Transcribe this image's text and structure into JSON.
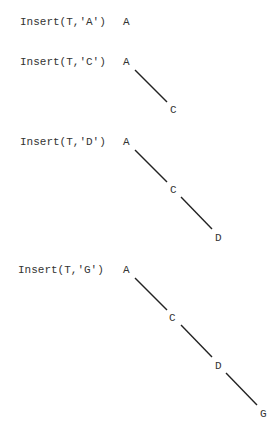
{
  "steps": [
    {
      "label": "Insert(T,'A')",
      "nodes": [
        "A"
      ]
    },
    {
      "label": "Insert(T,'C')",
      "nodes": [
        "A",
        "C"
      ]
    },
    {
      "label": "Insert(T,'D')",
      "nodes": [
        "A",
        "C",
        "D"
      ]
    },
    {
      "label": "Insert(T,'G')",
      "nodes": [
        "A",
        "C",
        "D",
        "G"
      ]
    }
  ],
  "colors": {
    "text": "#333333",
    "edge": "#222222",
    "background": "#ffffff"
  }
}
